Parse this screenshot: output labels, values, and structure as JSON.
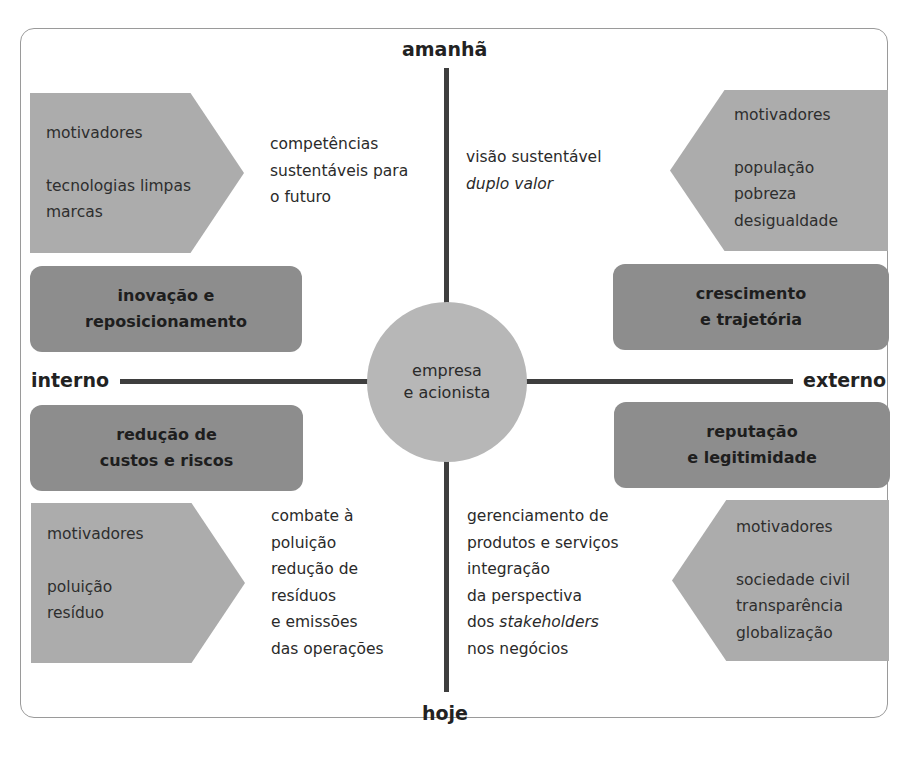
{
  "axes": {
    "top": "amanhã",
    "bottom": "hoje",
    "left": "interno",
    "right": "externo"
  },
  "center": {
    "lines": [
      "empresa",
      "e acionista"
    ]
  },
  "quadrants": {
    "top_left": {
      "drivers_title": "motivadores",
      "drivers": [
        "tecnologias limpas",
        "marcas"
      ],
      "strategy": [
        "inovação e",
        "reposicionamento"
      ],
      "outcome": [
        "competências",
        "sustentáveis para",
        "o futuro"
      ]
    },
    "top_right": {
      "drivers_title": "motivadores",
      "drivers": [
        "população",
        "pobreza",
        "desigualdade"
      ],
      "strategy": [
        "crescimento",
        "e trajetória"
      ],
      "outcome": [
        "visão sustentável"
      ],
      "outcome_italic": "duplo valor"
    },
    "bottom_left": {
      "drivers_title": "motivadores",
      "drivers": [
        "poluição",
        "resíduo"
      ],
      "strategy": [
        "redução de",
        "custos e riscos"
      ],
      "outcome": [
        "combate à",
        "poluição",
        "redução de",
        "resíduos",
        "e emissões",
        "das operações"
      ]
    },
    "bottom_right": {
      "drivers_title": "motivadores",
      "drivers": [
        "sociedade civil",
        "transparência",
        "globalização"
      ],
      "strategy": [
        "reputação",
        "e legitimidade"
      ],
      "outcome": [
        "gerenciamento de",
        "produtos e serviços",
        "integração",
        "da perspectiva"
      ],
      "outcome_mixed_prefix": "dos ",
      "outcome_mixed_italic": "stakeholders",
      "outcome_last": "nos negócios"
    }
  },
  "colors": {
    "drivers_fill": "#acacac",
    "strategy_fill": "#8d8d8d",
    "center_fill": "#b7b7b7",
    "axis": "#3e3e3e",
    "frame_border": "#9a9a9a"
  }
}
